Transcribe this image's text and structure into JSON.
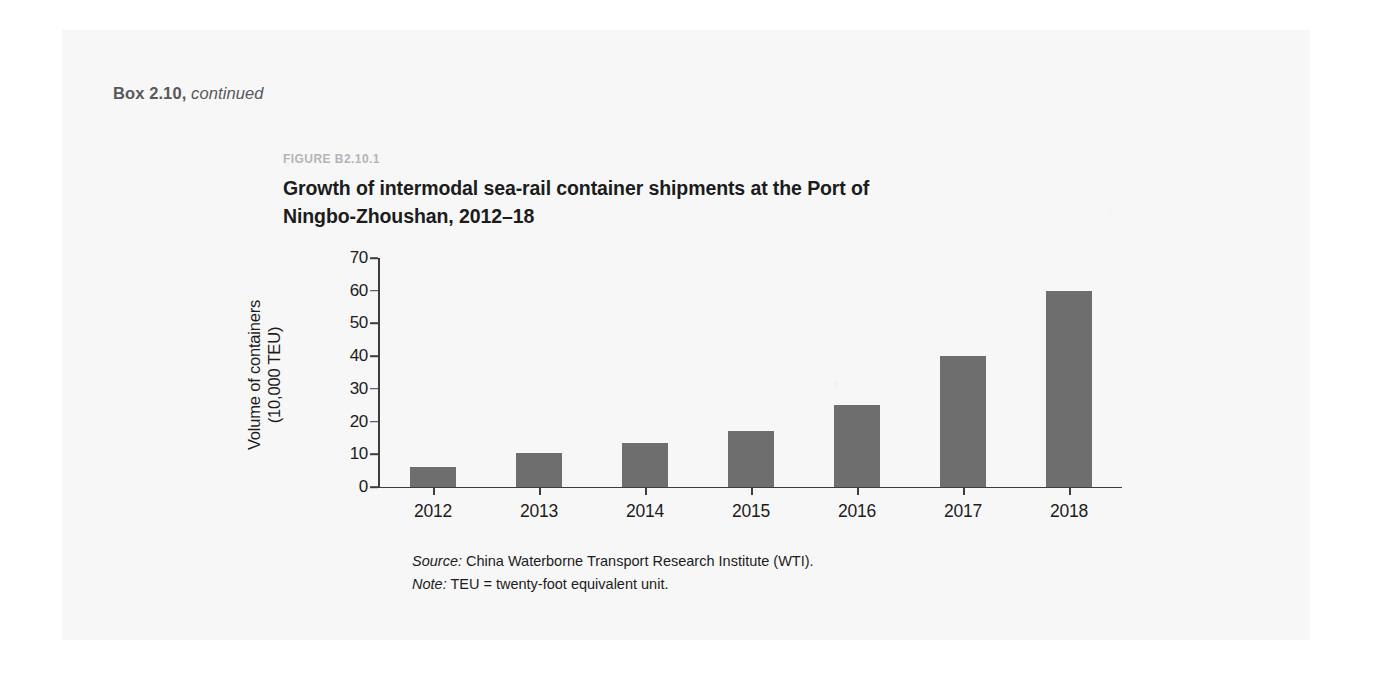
{
  "box": {
    "header_label": "Box 2.10,",
    "header_continued": "continued"
  },
  "figure": {
    "number": "FIGURE B2.10.1",
    "title": "Growth of intermodal sea-rail container shipments at the Port of Ningbo-Zhoushan, 2012–18",
    "source_lead": "Source:",
    "source_text": " China Waterborne Transport Research Institute (WTI).",
    "note_lead": "Note:",
    "note_text": " TEU = twenty-foot equivalent unit."
  },
  "colors": {
    "bar": "#6e6e6e",
    "axis": "#3d3d3d",
    "figure_number": "#b3b5b7",
    "box_header": "#58585a",
    "panel": "#f7f7f7"
  },
  "chart_data": {
    "type": "bar",
    "title": "Growth of intermodal sea-rail container shipments at the Port of Ningbo-Zhoushan, 2012–18",
    "xlabel": "",
    "ylabel": "Volume of containers (10,000 TEU)",
    "ylabel_line1": "Volume of containers",
    "ylabel_line2": "(10,000 TEU)",
    "categories": [
      "2012",
      "2013",
      "2014",
      "2015",
      "2016",
      "2017",
      "2018"
    ],
    "values": [
      6,
      10.5,
      13.5,
      17,
      25,
      40,
      60
    ],
    "ylim": [
      0,
      70
    ],
    "yticks": [
      0,
      10,
      20,
      30,
      40,
      50,
      60,
      70
    ],
    "ytick_labels": [
      "0",
      "10",
      "20",
      "30",
      "40",
      "50",
      "60",
      "70"
    ],
    "grid": false,
    "legend": false,
    "series": [
      {
        "name": "Volume of containers (10,000 TEU)",
        "values": [
          6,
          10.5,
          13.5,
          17,
          25,
          40,
          60
        ]
      }
    ]
  }
}
